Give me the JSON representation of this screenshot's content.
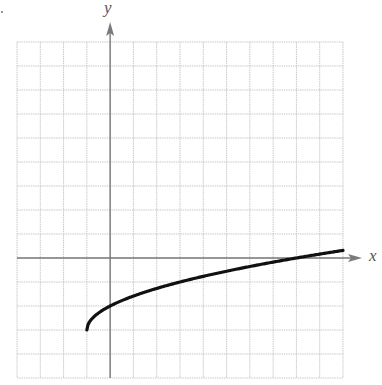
{
  "chart_data": {
    "type": "line",
    "title": "",
    "xlabel": "x",
    "ylabel": "y",
    "function": "y = sqrt(x + 1) - 3",
    "xlim": [
      -4,
      10
    ],
    "ylim": [
      -5,
      9
    ],
    "grid": true,
    "legend": null,
    "tick_labels": false,
    "series": [
      {
        "name": "curve",
        "start_point": [
          -1,
          -3
        ],
        "x": [
          -1,
          -0.75,
          -0.5,
          0,
          1,
          2,
          3,
          4,
          5,
          6,
          7,
          8,
          9,
          10
        ],
        "y": [
          -3,
          -2.5,
          -2.29,
          -2,
          -1.59,
          -1.27,
          -1,
          -0.76,
          -0.55,
          -0.35,
          -0.17,
          0,
          0.16,
          0.32
        ]
      }
    ]
  },
  "labels": {
    "x_axis": "x",
    "y_axis": "y"
  },
  "colors": {
    "grid": "#c8c8c8",
    "axis": "#7a7a7a",
    "curve": "#111111"
  }
}
